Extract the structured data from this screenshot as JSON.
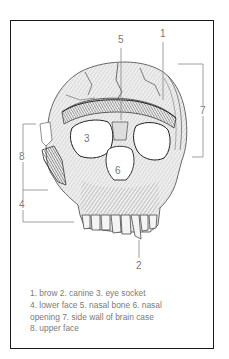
{
  "figure": {
    "labels": {
      "l1": "1",
      "l2": "2",
      "l3": "3",
      "l4": "4",
      "l5": "5",
      "l6": "6",
      "l7": "7",
      "l8": "8"
    },
    "caption": {
      "line1": "1. brow 2. canine 3. eye socket",
      "line2": "4. lower face 5. nasal bone 6. nasal",
      "line3": "opening 7. side wall of brain case",
      "line4": "8. upper face"
    },
    "legend": [
      {
        "num": "1",
        "name": "brow"
      },
      {
        "num": "2",
        "name": "canine"
      },
      {
        "num": "3",
        "name": "eye socket"
      },
      {
        "num": "4",
        "name": "lower face"
      },
      {
        "num": "5",
        "name": "nasal bone"
      },
      {
        "num": "6",
        "name": "nasal opening"
      },
      {
        "num": "7",
        "name": "side wall of brain case"
      },
      {
        "num": "8",
        "name": "upper face"
      }
    ]
  }
}
